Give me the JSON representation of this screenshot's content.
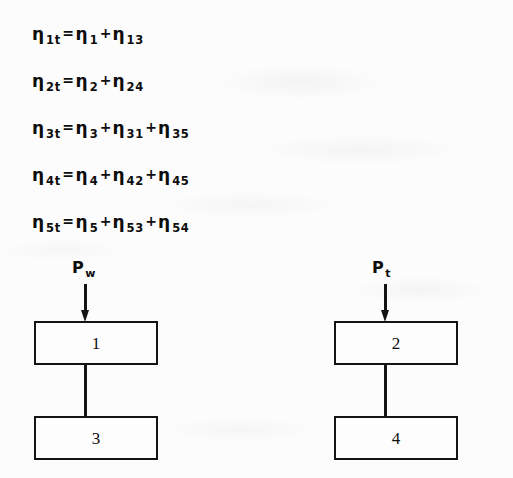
{
  "document": {
    "kind": "scanned-page",
    "background_color": "#fcfcfc",
    "ink_color": "#141414"
  },
  "equations": [
    {
      "id": "eta-1t",
      "lhs": {
        "symbol": "η",
        "sub": "1t"
      },
      "relation": "=",
      "terms": [
        {
          "symbol": "η",
          "sub": "1"
        },
        {
          "symbol": "η",
          "sub": "13"
        }
      ],
      "operators": [
        "+"
      ],
      "plain": "η 1t = η 1 + η 13"
    },
    {
      "id": "eta-2t",
      "lhs": {
        "symbol": "η",
        "sub": "2t"
      },
      "relation": "=",
      "terms": [
        {
          "symbol": "η",
          "sub": "2"
        },
        {
          "symbol": "η",
          "sub": "24"
        }
      ],
      "operators": [
        "+"
      ],
      "plain": "η 2t = η 2 + η 24"
    },
    {
      "id": "eta-3t",
      "lhs": {
        "symbol": "η",
        "sub": "3t"
      },
      "relation": "=",
      "terms": [
        {
          "symbol": "η",
          "sub": "3"
        },
        {
          "symbol": "η",
          "sub": "31"
        },
        {
          "symbol": "η",
          "sub": "35"
        }
      ],
      "operators": [
        "+",
        "+"
      ],
      "plain": "η 3t = η 3 + η 31 + η 35"
    },
    {
      "id": "eta-4t",
      "lhs": {
        "symbol": "η",
        "sub": "4t"
      },
      "relation": "=",
      "terms": [
        {
          "symbol": "η",
          "sub": "4"
        },
        {
          "symbol": "η",
          "sub": "42"
        },
        {
          "symbol": "η",
          "sub": "45"
        }
      ],
      "operators": [
        "+",
        "+"
      ],
      "plain": "η 4t = η 4 + η 42 + η 45"
    },
    {
      "id": "eta-5t",
      "lhs": {
        "symbol": "η",
        "sub": "5t"
      },
      "relation": "=",
      "terms": [
        {
          "symbol": "η",
          "sub": "5"
        },
        {
          "symbol": "η",
          "sub": "53"
        },
        {
          "symbol": "η",
          "sub": "54"
        }
      ],
      "operators": [
        "+",
        "+"
      ],
      "plain": "η 5t = η 5 + η 53 + η 54"
    }
  ],
  "diagram": {
    "type": "block-diagram",
    "chains": [
      {
        "id": "chain-left",
        "input": {
          "symbol": "P",
          "sub": "w",
          "plain": "Pw"
        },
        "input_arrow": "down-arrow-icon",
        "top_block": {
          "label": "1"
        },
        "connector": "vertical-line",
        "bottom_block": {
          "label": "3"
        }
      },
      {
        "id": "chain-right",
        "input": {
          "symbol": "P",
          "sub": "t",
          "plain": "Pt"
        },
        "input_arrow": "down-arrow-icon",
        "top_block": {
          "label": "2"
        },
        "connector": "vertical-line",
        "bottom_block": {
          "label": "4"
        }
      }
    ]
  }
}
